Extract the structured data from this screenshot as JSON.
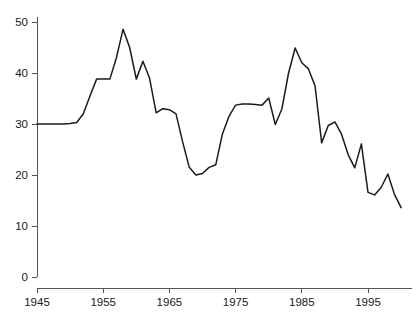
{
  "chart_data": {
    "type": "line",
    "title": "",
    "subtitle": "",
    "xlabel": "",
    "ylabel": "",
    "xlim": [
      1945,
      2001
    ],
    "ylim": [
      0,
      52
    ],
    "grid": false,
    "legend": false,
    "legend_position": "none",
    "line_color": "#1b1b1b",
    "axis_color": "#555555",
    "text_color": "#1a1a1a",
    "background_color": "#ffffff",
    "x_ticks": [
      1945,
      1955,
      1965,
      1975,
      1985,
      1995
    ],
    "x_tick_labels": [
      "1945",
      "1955",
      "1965",
      "1975",
      "1985",
      "1995"
    ],
    "y_ticks": [
      0,
      10,
      20,
      30,
      40,
      50
    ],
    "y_tick_labels": [
      "0",
      "10",
      "20",
      "30",
      "40",
      "50"
    ],
    "x": [
      1945,
      1946,
      1947,
      1948,
      1949,
      1950,
      1951,
      1952,
      1953,
      1954,
      1955,
      1956,
      1957,
      1958,
      1959,
      1960,
      1961,
      1962,
      1963,
      1964,
      1965,
      1966,
      1967,
      1968,
      1969,
      1970,
      1971,
      1972,
      1973,
      1974,
      1975,
      1976,
      1977,
      1978,
      1979,
      1980,
      1981,
      1982,
      1983,
      1984,
      1985,
      1986,
      1987,
      1988,
      1989,
      1990,
      1991,
      1992,
      1993,
      1994,
      1995,
      1996,
      1997,
      1998,
      1999,
      2000
    ],
    "values": [
      30.0,
      30.0,
      30.0,
      30.0,
      30.0,
      30.1,
      30.3,
      32.0,
      35.5,
      38.8,
      38.8,
      38.8,
      43.0,
      48.6,
      45.0,
      38.8,
      42.3,
      39.0,
      32.2,
      33.0,
      32.8,
      32.0,
      26.5,
      21.5,
      20.0,
      20.3,
      21.5,
      22.0,
      28.0,
      31.5,
      33.7,
      33.9,
      33.9,
      33.8,
      33.7,
      35.1,
      29.9,
      33.0,
      40.0,
      44.9,
      42.0,
      40.8,
      37.5,
      26.3,
      29.7,
      30.4,
      28.0,
      24.0,
      21.4,
      26.1,
      16.6,
      16.1,
      17.6,
      20.2,
      16.2,
      13.6
    ],
    "series": [
      {
        "name": "series-1",
        "values": [
          30.0,
          30.0,
          30.0,
          30.0,
          30.0,
          30.1,
          30.3,
          32.0,
          35.5,
          38.8,
          38.8,
          38.8,
          43.0,
          48.6,
          45.0,
          38.8,
          42.3,
          39.0,
          32.2,
          33.0,
          32.8,
          32.0,
          26.5,
          21.5,
          20.0,
          20.3,
          21.5,
          22.0,
          28.0,
          31.5,
          33.7,
          33.9,
          33.9,
          33.8,
          33.7,
          35.1,
          29.9,
          33.0,
          40.0,
          44.9,
          42.0,
          40.8,
          37.5,
          26.3,
          29.7,
          30.4,
          28.0,
          24.0,
          21.4,
          26.1,
          16.6,
          16.1,
          17.6,
          20.2,
          16.2,
          13.6
        ]
      }
    ]
  }
}
